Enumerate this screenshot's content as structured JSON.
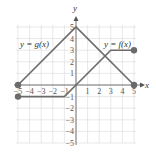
{
  "chart_data": {
    "type": "line",
    "title": "",
    "xlabel": "x",
    "ylabel": "y",
    "xlim": [
      -5,
      5
    ],
    "ylim": [
      -5,
      5
    ],
    "grid": true,
    "x_ticks": [
      -5,
      -4,
      -3,
      -2,
      -1,
      1,
      2,
      3,
      4,
      5
    ],
    "y_ticks": [
      -5,
      -4,
      -3,
      -2,
      -1,
      1,
      2,
      3,
      4,
      5
    ],
    "series": [
      {
        "name": "y = g(x)",
        "points": [
          [
            -5,
            0
          ],
          [
            0,
            5
          ],
          [
            5,
            0
          ]
        ],
        "closed_endpoints": [
          [
            -5,
            0
          ],
          [
            5,
            0
          ]
        ]
      },
      {
        "name": "y = f(x)",
        "points": [
          [
            -5,
            -1
          ],
          [
            -1,
            -1
          ],
          [
            0,
            0
          ],
          [
            3,
            3
          ],
          [
            5,
            3
          ]
        ],
        "closed_endpoints": [
          [
            -5,
            -1
          ],
          [
            5,
            3
          ]
        ]
      }
    ],
    "annotations": [
      {
        "text": "y = g(x)",
        "at": [
          -3.3,
          3.5
        ]
      },
      {
        "text": "y = f(x)",
        "at": [
          3.3,
          3.5
        ]
      }
    ]
  },
  "labels": {
    "x_axis": "x",
    "y_axis": "y",
    "g_label": "y = g(x)",
    "f_label": "y = f(x)"
  },
  "colors": {
    "curve": "#6b6b6b",
    "axis": "#555555",
    "grid": "#d9d9d9",
    "point": "#6b6b6b"
  }
}
